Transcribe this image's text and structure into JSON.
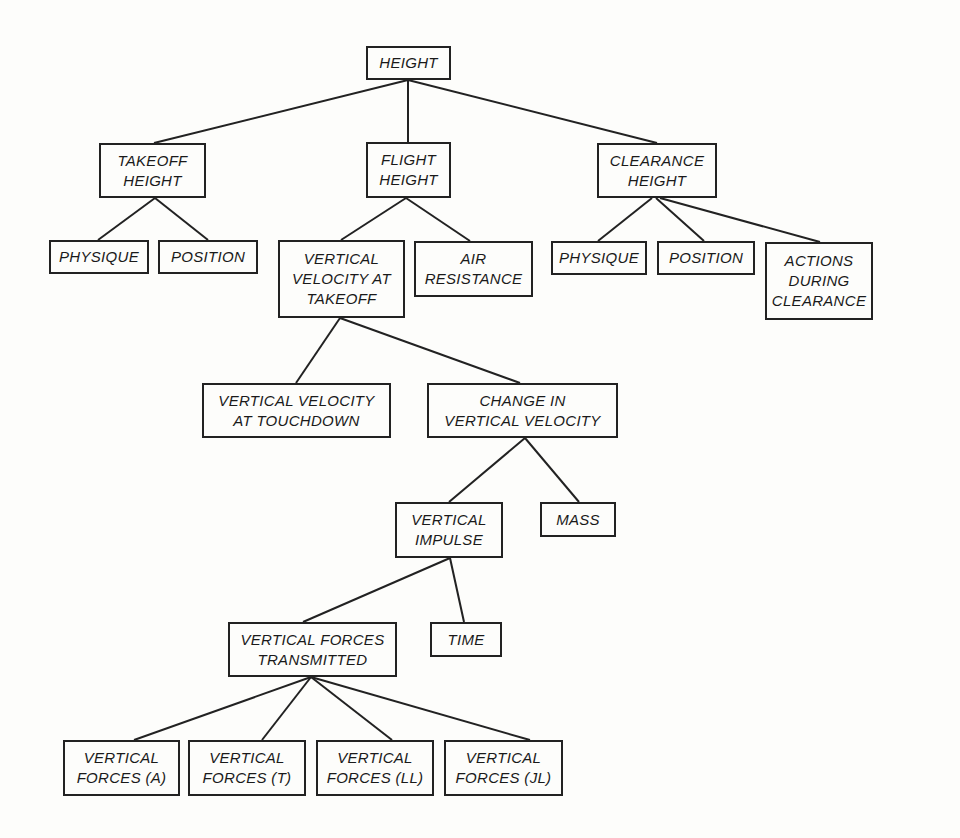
{
  "diagram": {
    "nodes": [
      {
        "id": "height",
        "label": "HEIGHT",
        "x": 366,
        "y": 46,
        "w": 85,
        "h": 34
      },
      {
        "id": "takeoff_height",
        "label": "TAKEOFF\nHEIGHT",
        "x": 99,
        "y": 143,
        "w": 107,
        "h": 55
      },
      {
        "id": "flight_height",
        "label": "FLIGHT\nHEIGHT",
        "x": 366,
        "y": 142,
        "w": 85,
        "h": 56
      },
      {
        "id": "clearance_height",
        "label": "CLEARANCE\nHEIGHT",
        "x": 597,
        "y": 143,
        "w": 120,
        "h": 55
      },
      {
        "id": "physique_1",
        "label": "PHYSIQUE",
        "x": 49,
        "y": 240,
        "w": 100,
        "h": 34
      },
      {
        "id": "position_1",
        "label": "POSITION",
        "x": 158,
        "y": 240,
        "w": 100,
        "h": 34
      },
      {
        "id": "vv_takeoff",
        "label": "VERTICAL\nVELOCITY AT\nTAKEOFF",
        "x": 278,
        "y": 240,
        "w": 127,
        "h": 78
      },
      {
        "id": "air_resistance",
        "label": "AIR\nRESISTANCE",
        "x": 414,
        "y": 241,
        "w": 119,
        "h": 56
      },
      {
        "id": "physique_2",
        "label": "PHYSIQUE",
        "x": 551,
        "y": 241,
        "w": 96,
        "h": 34
      },
      {
        "id": "position_2",
        "label": "POSITION",
        "x": 657,
        "y": 241,
        "w": 98,
        "h": 34
      },
      {
        "id": "actions_clearance",
        "label": "ACTIONS\nDURING\nCLEARANCE",
        "x": 765,
        "y": 242,
        "w": 108,
        "h": 78
      },
      {
        "id": "vv_touchdown",
        "label": "VERTICAL VELOCITY\nAT TOUCHDOWN",
        "x": 202,
        "y": 383,
        "w": 189,
        "h": 55
      },
      {
        "id": "change_vv",
        "label": "CHANGE IN\nVERTICAL VELOCITY",
        "x": 427,
        "y": 383,
        "w": 191,
        "h": 55
      },
      {
        "id": "vertical_impulse",
        "label": "VERTICAL\nIMPULSE",
        "x": 395,
        "y": 502,
        "w": 108,
        "h": 56
      },
      {
        "id": "mass",
        "label": "MASS",
        "x": 540,
        "y": 502,
        "w": 76,
        "h": 35
      },
      {
        "id": "vf_transmitted",
        "label": "VERTICAL FORCES\nTRANSMITTED",
        "x": 228,
        "y": 622,
        "w": 169,
        "h": 55
      },
      {
        "id": "time",
        "label": "TIME",
        "x": 430,
        "y": 622,
        "w": 72,
        "h": 35
      },
      {
        "id": "vf_a",
        "label": "VERTICAL\nFORCES (A)",
        "x": 63,
        "y": 740,
        "w": 117,
        "h": 56
      },
      {
        "id": "vf_t",
        "label": "VERTICAL\nFORCES (T)",
        "x": 188,
        "y": 740,
        "w": 118,
        "h": 56
      },
      {
        "id": "vf_ll",
        "label": "VERTICAL\nFORCES (LL)",
        "x": 316,
        "y": 740,
        "w": 118,
        "h": 56
      },
      {
        "id": "vf_jl",
        "label": "VERTICAL\nFORCES (JL)",
        "x": 444,
        "y": 740,
        "w": 119,
        "h": 56
      }
    ],
    "edges": [
      {
        "from": "height",
        "to": "takeoff_height",
        "x1": 408,
        "y1": 80,
        "x2": 154,
        "y2": 143
      },
      {
        "from": "height",
        "to": "flight_height",
        "x1": 408,
        "y1": 80,
        "x2": 408,
        "y2": 142
      },
      {
        "from": "height",
        "to": "clearance_height",
        "x1": 408,
        "y1": 80,
        "x2": 657,
        "y2": 143
      },
      {
        "from": "takeoff_height",
        "to": "physique_1",
        "x1": 155,
        "y1": 198,
        "x2": 98,
        "y2": 240
      },
      {
        "from": "takeoff_height",
        "to": "position_1",
        "x1": 155,
        "y1": 198,
        "x2": 208,
        "y2": 240
      },
      {
        "from": "flight_height",
        "to": "vv_takeoff",
        "x1": 406,
        "y1": 198,
        "x2": 341,
        "y2": 240
      },
      {
        "from": "flight_height",
        "to": "air_resistance",
        "x1": 406,
        "y1": 198,
        "x2": 470,
        "y2": 241
      },
      {
        "from": "clearance_height",
        "to": "physique_2",
        "x1": 652,
        "y1": 198,
        "x2": 598,
        "y2": 241
      },
      {
        "from": "clearance_height",
        "to": "position_2",
        "x1": 656,
        "y1": 198,
        "x2": 704,
        "y2": 241
      },
      {
        "from": "clearance_height",
        "to": "actions_clearance",
        "x1": 660,
        "y1": 198,
        "x2": 820,
        "y2": 242
      },
      {
        "from": "vv_takeoff",
        "to": "vv_touchdown",
        "x1": 340,
        "y1": 318,
        "x2": 296,
        "y2": 383
      },
      {
        "from": "vv_takeoff",
        "to": "change_vv",
        "x1": 340,
        "y1": 318,
        "x2": 520,
        "y2": 383
      },
      {
        "from": "change_vv",
        "to": "vertical_impulse",
        "x1": 525,
        "y1": 438,
        "x2": 449,
        "y2": 502
      },
      {
        "from": "change_vv",
        "to": "mass",
        "x1": 525,
        "y1": 438,
        "x2": 579,
        "y2": 502
      },
      {
        "from": "vertical_impulse",
        "to": "vf_transmitted",
        "x1": 450,
        "y1": 558,
        "x2": 303,
        "y2": 622
      },
      {
        "from": "vertical_impulse",
        "to": "time",
        "x1": 450,
        "y1": 558,
        "x2": 464,
        "y2": 622
      },
      {
        "from": "vf_transmitted",
        "to": "vf_a",
        "x1": 311,
        "y1": 677,
        "x2": 134,
        "y2": 740
      },
      {
        "from": "vf_transmitted",
        "to": "vf_t",
        "x1": 311,
        "y1": 677,
        "x2": 262,
        "y2": 740
      },
      {
        "from": "vf_transmitted",
        "to": "vf_ll",
        "x1": 311,
        "y1": 677,
        "x2": 392,
        "y2": 740
      },
      {
        "from": "vf_transmitted",
        "to": "vf_jl",
        "x1": 311,
        "y1": 677,
        "x2": 530,
        "y2": 740
      }
    ]
  }
}
